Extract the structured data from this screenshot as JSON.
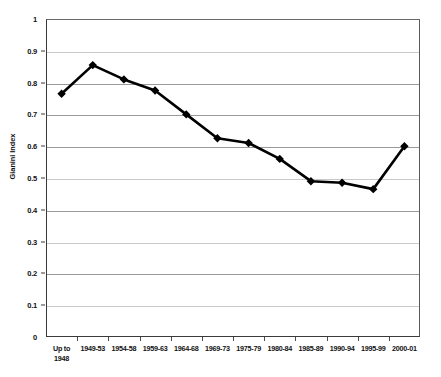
{
  "chart_data": {
    "type": "line",
    "title": "",
    "xlabel": "",
    "ylabel": "Gianini Index",
    "ylim": [
      0,
      1
    ],
    "ytick_step": 0.1,
    "yticks": [
      "0",
      "0.1",
      "0.2",
      "0.3",
      "0.4",
      "0.5",
      "0.6",
      "0.7",
      "0.8",
      "0.9",
      "1"
    ],
    "grid": true,
    "legend": "none",
    "marker": "diamond",
    "line_color": "#000000",
    "marker_color": "#000000",
    "categories": [
      "Up to\n1948",
      "1949-53",
      "1954-58",
      "1959-63",
      "1964-68",
      "1969-73",
      "1975-79",
      "1980-84",
      "1985-89",
      "1990-94",
      "1995-99",
      "2000-01"
    ],
    "series": [
      {
        "name": "Gianini Index",
        "values": [
          0.765,
          0.855,
          0.81,
          0.775,
          0.7,
          0.625,
          0.61,
          0.56,
          0.49,
          0.485,
          0.465,
          0.6
        ]
      }
    ]
  },
  "colors": {
    "axis": "#3a3a3a",
    "gridline": "#9a9a9a",
    "series": "#000000",
    "background": "#ffffff"
  }
}
